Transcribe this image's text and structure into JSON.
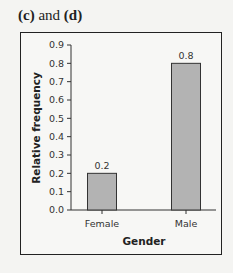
{
  "caption": {
    "part1": "(c)",
    "middle": " and ",
    "part2": "(d)"
  },
  "chart_data": {
    "type": "bar",
    "title": "",
    "xlabel": "Gender",
    "ylabel": "Relative frequency",
    "categories": [
      "Female",
      "Male"
    ],
    "values": [
      0.2,
      0.8
    ],
    "value_labels": [
      "0.2",
      "0.8"
    ],
    "ylim": [
      0,
      0.9
    ],
    "yticks": [
      "0.0",
      "0.1",
      "0.2",
      "0.3",
      "0.4",
      "0.5",
      "0.6",
      "0.7",
      "0.8",
      "0.9"
    ],
    "grid": false,
    "legend": null,
    "bar_color": "#b3b3b3",
    "bar_edge_color": "#333333"
  }
}
